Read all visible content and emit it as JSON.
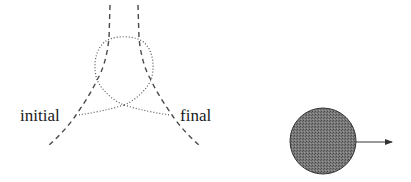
{
  "diagram": {
    "labels": {
      "initial": "initial",
      "final": "final"
    },
    "colors": {
      "stroke": "#444444",
      "ball_fill": "#6f6f6f",
      "ball_stroke": "#333333",
      "arrow": "#333333"
    },
    "left_panel": {
      "description": "Two dashed trajectories entering from top, with a dotted loop and dotted lines connecting to labels"
    },
    "right_panel": {
      "description": "Shaded circle with arrow pointing right"
    }
  }
}
